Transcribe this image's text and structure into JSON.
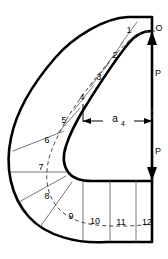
{
  "figure": {
    "background_color": "#ffffff",
    "line_color": "#000000",
    "divider_color": "#555555"
  },
  "labels": {
    "origin_point": "O",
    "force_upper": "P",
    "force_lower": "P",
    "dimension_main": "a",
    "dimension_subscript": "4"
  },
  "segments": [
    {
      "id": "1",
      "label": "1",
      "x": 129,
      "y": 31
    },
    {
      "id": "2",
      "label": "2",
      "x": 115,
      "y": 56
    },
    {
      "id": "3",
      "label": "3",
      "x": 99,
      "y": 78
    },
    {
      "id": "4",
      "label": "4",
      "x": 82,
      "y": 98
    },
    {
      "id": "5",
      "label": "5",
      "x": 64,
      "y": 121
    },
    {
      "id": "6",
      "label": "6",
      "x": 47,
      "y": 141
    },
    {
      "id": "7",
      "label": "7",
      "x": 41,
      "y": 168
    },
    {
      "id": "8",
      "label": "8",
      "x": 47,
      "y": 197
    },
    {
      "id": "9",
      "label": "9",
      "x": 71,
      "y": 217
    },
    {
      "id": "10",
      "label": "10",
      "x": 95,
      "y": 222
    },
    {
      "id": "11",
      "label": "11",
      "x": 121,
      "y": 223
    },
    {
      "id": "12",
      "label": "12",
      "x": 147,
      "y": 223
    }
  ],
  "annotations": {
    "origin": {
      "x": 158,
      "y": 29
    },
    "force_upper_pos": {
      "x": 157,
      "y": 74
    },
    "force_lower_pos": {
      "x": 157,
      "y": 152
    },
    "dimension_pos": {
      "x": 119,
      "y": 121
    }
  },
  "geometry": {
    "outer_boundary_note": "thick closed hook outline",
    "inner_boundary_note": "thick rounded inner notch",
    "divider_count": 12,
    "centerline_style": "dashed"
  }
}
